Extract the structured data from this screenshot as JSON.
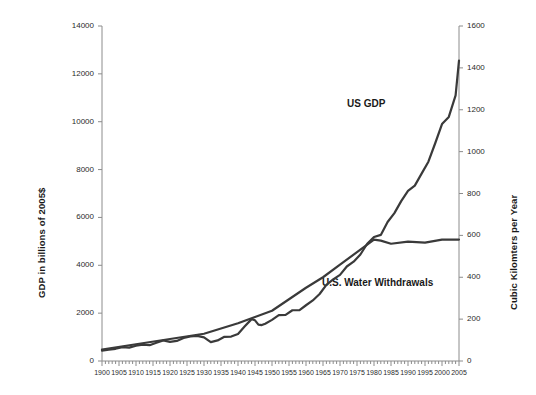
{
  "chart_data": {
    "type": "line",
    "title": "",
    "subtitle": "",
    "xlabel": "",
    "ylabel": "GDP in billions of 2005$",
    "ylabel_right": "Cubic Kilomters per Year",
    "xlim": [
      1900,
      2005
    ],
    "ylim": [
      0,
      14000
    ],
    "ylim_right": [
      0,
      1600
    ],
    "grid": false,
    "legend_position": "inline-annotations",
    "xtick_labels": [
      "1900",
      "1905",
      "1910",
      "1915",
      "1920",
      "1925",
      "1930",
      "1935",
      "1940",
      "1945",
      "1950",
      "1955",
      "1960",
      "1965",
      "1970",
      "1975",
      "1980",
      "1985",
      "1990",
      "1995",
      "2000",
      "2005"
    ],
    "xtick_values": [
      1900,
      1905,
      1910,
      1915,
      1920,
      1925,
      1930,
      1935,
      1940,
      1945,
      1950,
      1955,
      1960,
      1965,
      1970,
      1975,
      1980,
      1985,
      1990,
      1995,
      2000,
      2005
    ],
    "ytick_labels_left": [
      "0",
      "2000",
      "4000",
      "6000",
      "8000",
      "10000",
      "12000",
      "14000"
    ],
    "ytick_values_left": [
      0,
      2000,
      4000,
      6000,
      8000,
      10000,
      12000,
      14000
    ],
    "ytick_labels_right": [
      "0",
      "200",
      "400",
      "600",
      "800",
      "1000",
      "1200",
      "1400",
      "1600"
    ],
    "ytick_values_right": [
      0,
      200,
      400,
      600,
      800,
      1000,
      1200,
      1400,
      1600
    ],
    "minor_ticks_x": true,
    "series": [
      {
        "name": "US GDP",
        "axis": "left",
        "color": "#3a3a3a",
        "annotation": "US GDP",
        "x": [
          1900,
          1902,
          1904,
          1906,
          1908,
          1910,
          1912,
          1914,
          1916,
          1918,
          1920,
          1922,
          1924,
          1926,
          1928,
          1930,
          1932,
          1934,
          1936,
          1938,
          1940,
          1942,
          1944,
          1945,
          1946,
          1947,
          1948,
          1950,
          1952,
          1954,
          1956,
          1958,
          1960,
          1962,
          1964,
          1966,
          1968,
          1970,
          1972,
          1974,
          1976,
          1978,
          1980,
          1982,
          1984,
          1986,
          1988,
          1990,
          1992,
          1994,
          1996,
          1998,
          2000,
          2002,
          2004,
          2005
        ],
        "y": [
          430,
          470,
          510,
          580,
          560,
          640,
          680,
          660,
          760,
          860,
          800,
          840,
          960,
          1030,
          1050,
          990,
          790,
          860,
          1010,
          1020,
          1130,
          1450,
          1750,
          1700,
          1520,
          1500,
          1560,
          1720,
          1920,
          1930,
          2120,
          2120,
          2330,
          2530,
          2800,
          3180,
          3410,
          3600,
          3950,
          4150,
          4450,
          4900,
          5180,
          5270,
          5810,
          6180,
          6680,
          7110,
          7330,
          7830,
          8330,
          9100,
          9900,
          10200,
          11100,
          12550
        ],
        "y_note": "GDP in billions of 2005$, reaches about 12550 in 2005"
      },
      {
        "name": "U.S. Water Withdrawals",
        "axis": "right",
        "color": "#3a3a3a",
        "annotation": "U.S. Water Withdrawals",
        "x": [
          1900,
          1910,
          1920,
          1930,
          1940,
          1950,
          1955,
          1960,
          1965,
          1970,
          1975,
          1980,
          1982,
          1985,
          1990,
          1995,
          2000,
          2005
        ],
        "y": [
          55,
          80,
          105,
          130,
          180,
          240,
          295,
          350,
          400,
          460,
          520,
          580,
          575,
          560,
          570,
          565,
          580,
          580
        ],
        "y_note": "Cubic kilometers per year, plateaus near 580 after 1980"
      }
    ]
  },
  "annotations": {
    "us_gdp": "US GDP",
    "water": "U.S. Water Withdrawals"
  },
  "colors": {
    "line": "#3a3a3a",
    "axis": "#8c8c8c",
    "text": "#1a1a1a",
    "background": "#ffffff"
  }
}
